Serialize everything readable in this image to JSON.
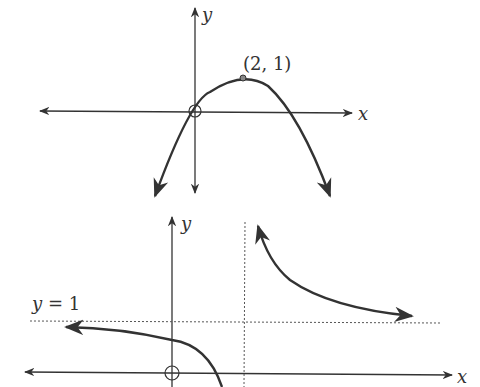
{
  "graph1": {
    "x_axis_label": "x",
    "y_axis_label": "y",
    "vertex_label": "(2, 1)",
    "curve": "downward parabola through origin (open circle) with vertex (2,1)"
  },
  "graph2": {
    "x_axis_label": "x",
    "y_axis_label": "y",
    "asymptote_label": "y = 1",
    "curve": "hyperbola with horizontal asymptote y=1 and vertical asymptote, open circle at origin"
  },
  "colors": {
    "ink": "#333333",
    "background": "#ffffff"
  }
}
